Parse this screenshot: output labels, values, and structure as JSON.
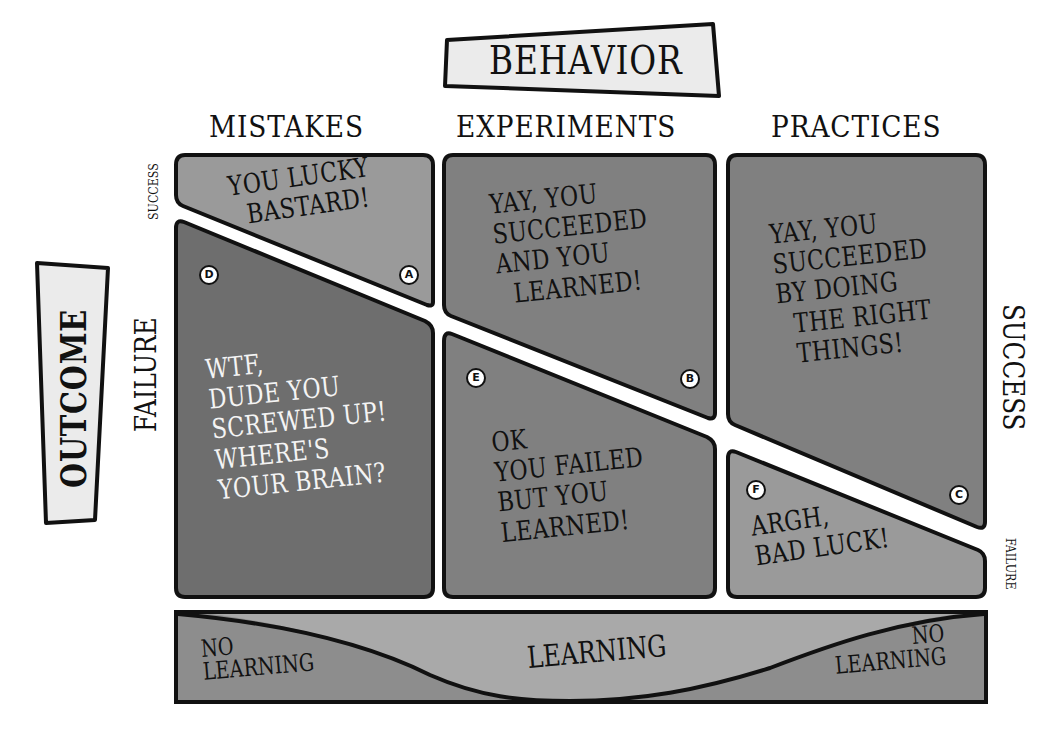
{
  "colors": {
    "background": "#ffffff",
    "panel_light": "#9a9a9a",
    "panel_mid": "#808080",
    "panel_dark": "#6e6e6e",
    "label_box": "#ebebeb",
    "outline": "#111111",
    "band_light": "#a9a9a9",
    "band_dark": "#8d8d8d"
  },
  "axes": {
    "behavior_title": "BEHAVIOR",
    "outcome_title": "OUTCOME",
    "columns": [
      "MISTAKES",
      "EXPERIMENTS",
      "PRACTICES"
    ],
    "left_success_label": "SUCCESS",
    "left_failure_label": "FAILURE",
    "right_success_label": "SUCCESS",
    "right_failure_label": "FAILURE"
  },
  "quadrants": [
    {
      "id": "A",
      "column": "MISTAKES",
      "outcome": "SUCCESS",
      "text": "YOU LUCKY\n  BASTARD!"
    },
    {
      "id": "B",
      "column": "EXPERIMENTS",
      "outcome": "SUCCESS",
      "text": "YAY, YOU\nSUCCEEDED\nAND YOU\n  LEARNED!"
    },
    {
      "id": "C",
      "column": "PRACTICES",
      "outcome": "SUCCESS",
      "text": "YAY, YOU\nSUCCEEDED\nBY DOING\n  THE RIGHT\n  THINGS!"
    },
    {
      "id": "D",
      "column": "MISTAKES",
      "outcome": "FAILURE",
      "text": "WTF,\nDUDE YOU\nSCREWED UP!\nWHERE'S\nYOUR BRAIN?"
    },
    {
      "id": "E",
      "column": "EXPERIMENTS",
      "outcome": "FAILURE",
      "text": "OK\nYOU FAILED\nBUT YOU\nLEARNED!"
    },
    {
      "id": "F",
      "column": "PRACTICES",
      "outcome": "FAILURE",
      "text": "ARGH,\nBAD LUCK!"
    }
  ],
  "learning_band": {
    "left": "NO\nLEARNING",
    "center": "LEARNING",
    "right": "NO\nLEARNING"
  }
}
